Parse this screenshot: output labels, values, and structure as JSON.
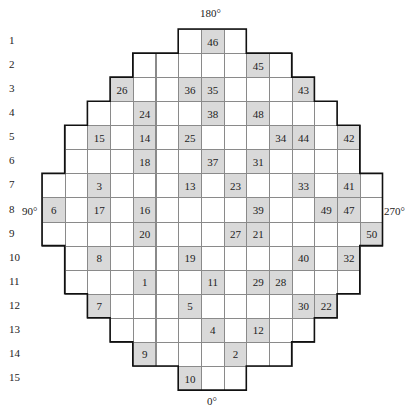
{
  "diagram": {
    "type": "core-loading-map",
    "angles": {
      "top": "180°",
      "bottom": "0°",
      "left": "90°",
      "right": "270°"
    },
    "row_labels": [
      "1",
      "2",
      "3",
      "4",
      "5",
      "6",
      "7",
      "8",
      "9",
      "10",
      "11",
      "12",
      "13",
      "14",
      "15"
    ],
    "rows": [
      {
        "row": 1,
        "start_col": 6,
        "end_col": 8,
        "numbered": [
          {
            "col": 7,
            "label": "46"
          }
        ]
      },
      {
        "row": 2,
        "start_col": 4,
        "end_col": 10,
        "numbered": [
          {
            "col": 9,
            "label": "45"
          }
        ]
      },
      {
        "row": 3,
        "start_col": 3,
        "end_col": 11,
        "numbered": [
          {
            "col": 3,
            "label": "26"
          },
          {
            "col": 6,
            "label": "36"
          },
          {
            "col": 7,
            "label": "35"
          },
          {
            "col": 11,
            "label": "43"
          }
        ]
      },
      {
        "row": 4,
        "start_col": 2,
        "end_col": 12,
        "numbered": [
          {
            "col": 4,
            "label": "24"
          },
          {
            "col": 7,
            "label": "38"
          },
          {
            "col": 9,
            "label": "48"
          }
        ]
      },
      {
        "row": 5,
        "start_col": 1,
        "end_col": 13,
        "numbered": [
          {
            "col": 2,
            "label": "15"
          },
          {
            "col": 4,
            "label": "14"
          },
          {
            "col": 6,
            "label": "25"
          },
          {
            "col": 10,
            "label": "34"
          },
          {
            "col": 11,
            "label": "44"
          },
          {
            "col": 13,
            "label": "42"
          }
        ]
      },
      {
        "row": 6,
        "start_col": 1,
        "end_col": 13,
        "numbered": [
          {
            "col": 4,
            "label": "18"
          },
          {
            "col": 7,
            "label": "37"
          },
          {
            "col": 9,
            "label": "31"
          }
        ]
      },
      {
        "row": 7,
        "start_col": 0,
        "end_col": 14,
        "numbered": [
          {
            "col": 2,
            "label": "3"
          },
          {
            "col": 6,
            "label": "13"
          },
          {
            "col": 8,
            "label": "23"
          },
          {
            "col": 11,
            "label": "33"
          },
          {
            "col": 13,
            "label": "41"
          }
        ]
      },
      {
        "row": 8,
        "start_col": 0,
        "end_col": 14,
        "numbered": [
          {
            "col": 0,
            "label": "6"
          },
          {
            "col": 2,
            "label": "17"
          },
          {
            "col": 4,
            "label": "16"
          },
          {
            "col": 9,
            "label": "39"
          },
          {
            "col": 12,
            "label": "49"
          },
          {
            "col": 13,
            "label": "47"
          }
        ]
      },
      {
        "row": 9,
        "start_col": 0,
        "end_col": 14,
        "numbered": [
          {
            "col": 4,
            "label": "20"
          },
          {
            "col": 8,
            "label": "27"
          },
          {
            "col": 9,
            "label": "21"
          },
          {
            "col": 14,
            "label": "50"
          }
        ]
      },
      {
        "row": 10,
        "start_col": 1,
        "end_col": 13,
        "numbered": [
          {
            "col": 2,
            "label": "8"
          },
          {
            "col": 6,
            "label": "19"
          },
          {
            "col": 11,
            "label": "40"
          },
          {
            "col": 13,
            "label": "32"
          }
        ]
      },
      {
        "row": 11,
        "start_col": 1,
        "end_col": 13,
        "numbered": [
          {
            "col": 4,
            "label": "1"
          },
          {
            "col": 7,
            "label": "11"
          },
          {
            "col": 9,
            "label": "29"
          },
          {
            "col": 10,
            "label": "28"
          }
        ]
      },
      {
        "row": 12,
        "start_col": 2,
        "end_col": 12,
        "numbered": [
          {
            "col": 2,
            "label": "7"
          },
          {
            "col": 6,
            "label": "5"
          },
          {
            "col": 11,
            "label": "30"
          },
          {
            "col": 12,
            "label": "22"
          }
        ]
      },
      {
        "row": 13,
        "start_col": 3,
        "end_col": 11,
        "numbered": [
          {
            "col": 7,
            "label": "4"
          },
          {
            "col": 9,
            "label": "12"
          }
        ]
      },
      {
        "row": 14,
        "start_col": 4,
        "end_col": 10,
        "numbered": [
          {
            "col": 4,
            "label": "9"
          },
          {
            "col": 8,
            "label": "2"
          }
        ]
      },
      {
        "row": 15,
        "start_col": 6,
        "end_col": 8,
        "numbered": [
          {
            "col": 6,
            "label": "10"
          }
        ]
      }
    ],
    "colors": {
      "highlight_cell": "#d9d9d9",
      "empty_cell": "#ffffff",
      "grid_line": "#8a8a8a",
      "outline": "#111111"
    }
  }
}
